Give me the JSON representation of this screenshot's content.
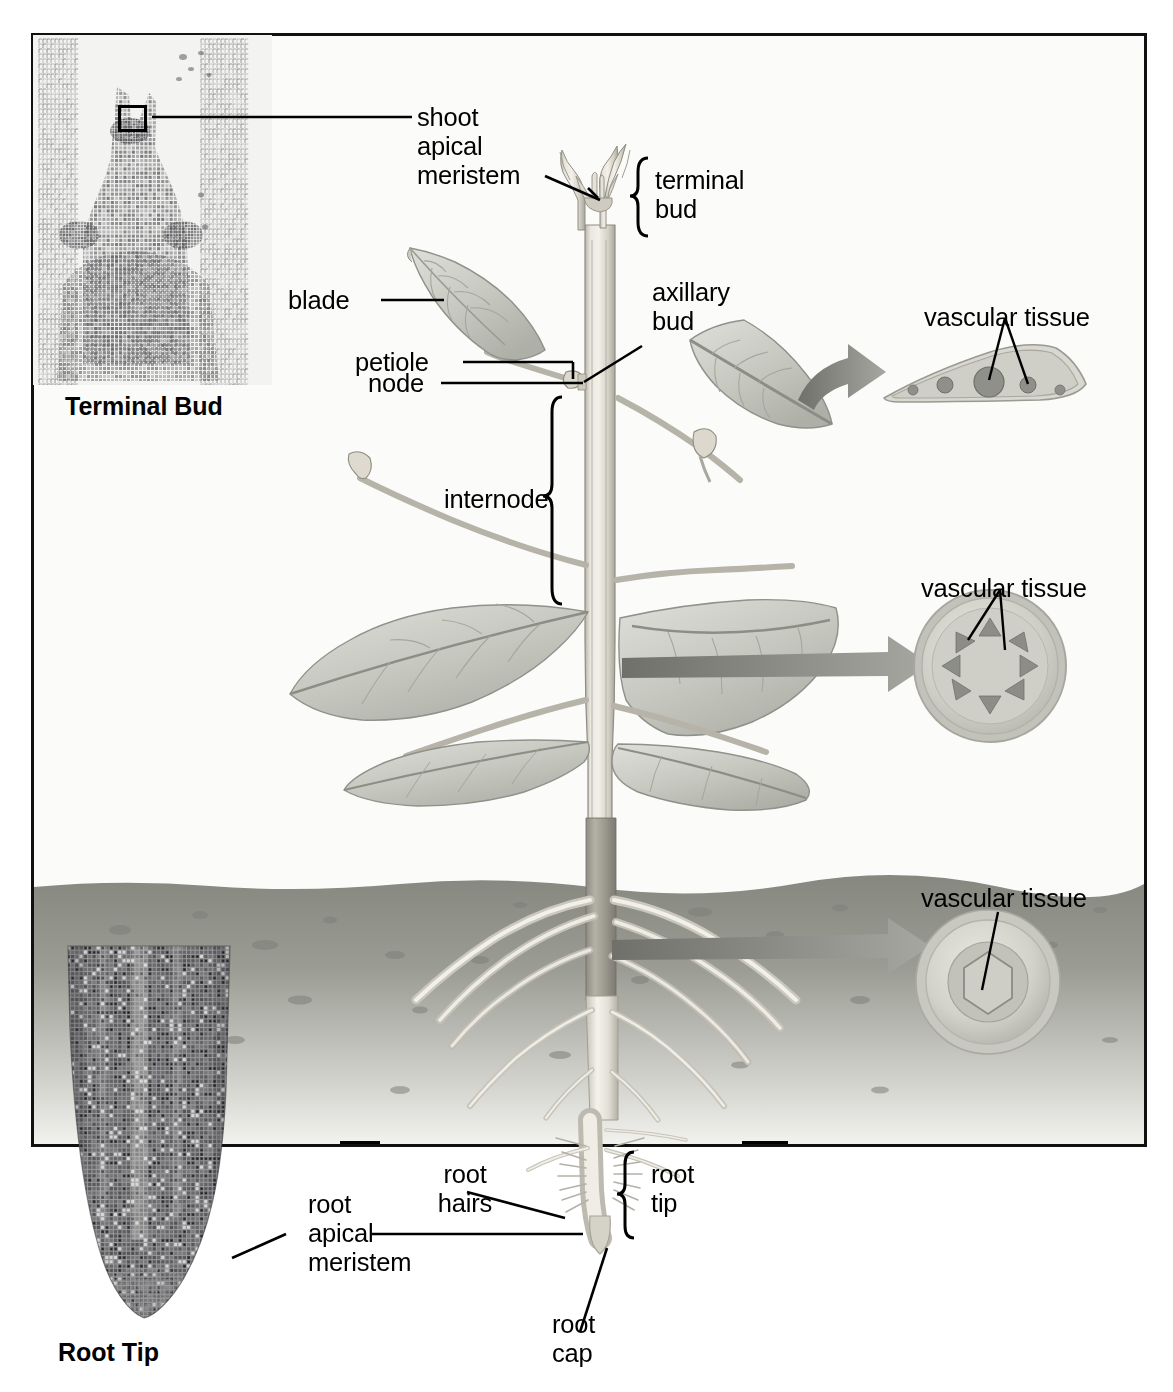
{
  "figure": {
    "type": "botanical-anatomy-diagram",
    "background_color": "#fbfbf9",
    "line_color": "#000000"
  },
  "insets": {
    "terminal_bud": {
      "caption": "Terminal Bud",
      "kind": "light-micrograph",
      "highlight_box": "shoot apical meristem"
    },
    "root_tip": {
      "caption": "Root Tip",
      "kind": "light-micrograph"
    }
  },
  "labels": {
    "shoot_apical_meristem": "shoot\napical\nmeristem",
    "terminal_bud": "terminal\nbud",
    "blade": "blade",
    "axillary_bud": "axillary\nbud",
    "petiole": "petiole",
    "node": "node",
    "internode": "internode",
    "vascular_tissue_leaf": "vascular tissue",
    "vascular_tissue_stem": "vascular tissue",
    "vascular_tissue_root": "vascular tissue",
    "root_hairs": "root\nhairs",
    "root_apical_meristem": "root\napical\nmeristem",
    "root_tip": "root\ntip",
    "root_cap": "root\ncap"
  },
  "cross_sections": {
    "leaf": {
      "title": "vascular tissue",
      "shape": "leaf blade transverse section",
      "vein_bundles": 5,
      "pointer_count": 2
    },
    "stem": {
      "title": "vascular tissue",
      "shape": "stem transverse section (circular)",
      "vascular_bundles": 8,
      "arrangement": "ring",
      "pointer_count": 2
    },
    "root": {
      "title": "vascular tissue",
      "shape": "root transverse section (circular)",
      "stele": "central vascular cylinder",
      "pointer_count": 1
    }
  },
  "plant": {
    "regions": [
      "shoot system",
      "root system"
    ],
    "soil_line_label": "",
    "leaf_count": 5,
    "soil_color": "#8e8f8a"
  },
  "palette": {
    "stem_light": "#e6e3da",
    "stem_mid": "#c8c4b8",
    "leaf_fill": "#c9cbc4",
    "leaf_edge": "#9a9c94",
    "soil_dark": "#8a8b85",
    "soil_light": "#d8d8d2",
    "arrow_gray": "#8d8e88",
    "vascular_dark": "#6f7169"
  }
}
